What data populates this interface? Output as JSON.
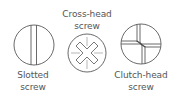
{
  "diagram": {
    "stroke_color": "#444444",
    "text_color": "#555555",
    "background": "#ffffff",
    "screws": [
      {
        "id": "slotted",
        "label_line1": "Slotted",
        "label_line2": "screw",
        "icon": "slotted-screw-head-icon"
      },
      {
        "id": "cross-head",
        "label_line1": "Cross-head",
        "label_line2": "screw",
        "icon": "cross-head-screw-icon"
      },
      {
        "id": "clutch-head",
        "label_line1": "Clutch-head",
        "label_line2": "screw",
        "icon": "clutch-head-screw-icon"
      }
    ]
  }
}
